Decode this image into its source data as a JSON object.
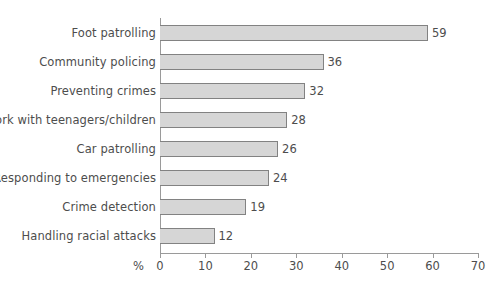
{
  "chart_data": {
    "type": "bar",
    "orientation": "horizontal",
    "title": "",
    "xlabel": "%",
    "ylabel": "",
    "xlim": [
      0,
      70
    ],
    "xticks": [
      0,
      10,
      20,
      30,
      40,
      50,
      60,
      70
    ],
    "grid": false,
    "legend": null,
    "categories": [
      "Foot patrolling",
      "Community policing",
      "Preventing crimes",
      "Work with teenagers/children",
      "Car patrolling",
      "Responding to emergencies",
      "Crime detection",
      "Handling racial attacks"
    ],
    "values": [
      59,
      36,
      32,
      28,
      26,
      24,
      19,
      12
    ],
    "value_labels": [
      "59",
      "36",
      "32",
      "28",
      "26",
      "24",
      "19",
      "12"
    ],
    "colors": {
      "bar_fill": "#d6d6d6",
      "bar_border": "#828282",
      "axis": "#9a9a9a",
      "text": "#4d4d4d",
      "background": "#ffffff"
    }
  },
  "axis": {
    "unit_label": "%",
    "tick_labels": [
      "0",
      "10",
      "20",
      "30",
      "40",
      "50",
      "60",
      "70"
    ]
  },
  "clipped_title": "Statistics"
}
